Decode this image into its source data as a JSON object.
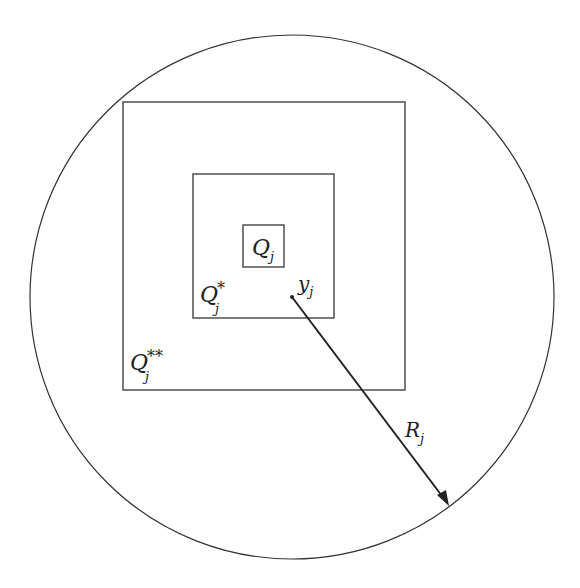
{
  "diagram": {
    "labels": {
      "q": "Q",
      "sub": "j",
      "star1": "*",
      "star2": "**",
      "y": "y",
      "r": "R"
    },
    "colors": {
      "stroke": "#333333",
      "background": "#ffffff"
    }
  }
}
